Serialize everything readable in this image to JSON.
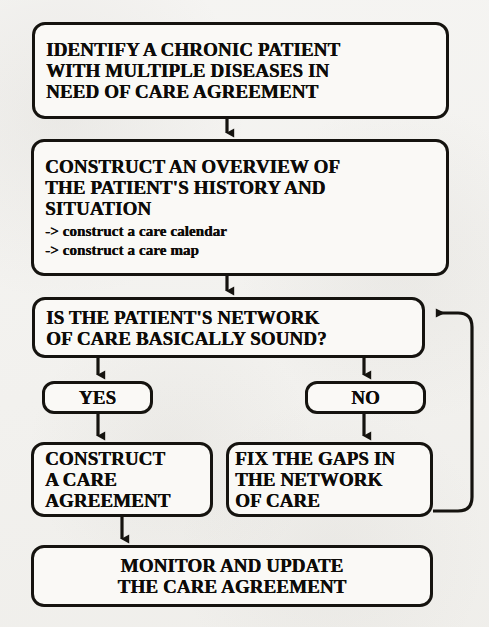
{
  "diagram": {
    "background_color": "#f2f1ee",
    "line_color": "#15130f",
    "node_fill_color": "#faf9f6",
    "nodes": {
      "identify": {
        "id": "identify",
        "shape": "rounded-rectangle",
        "lines": [
          "IDENTIFY A CHRONIC PATIENT",
          "WITH MULTIPLE DISEASES IN",
          "NEED OF CARE AGREEMENT"
        ]
      },
      "overview": {
        "id": "overview",
        "shape": "rounded-rectangle",
        "lines": [
          "CONSTRUCT AN OVERVIEW OF",
          "THE PATIENT'S HISTORY AND",
          "SITUATION"
        ],
        "sub_lines": [
          "-> construct a care calendar",
          "-> construct a care map"
        ]
      },
      "decision": {
        "id": "decision",
        "shape": "rounded-rectangle",
        "lines": [
          "IS THE PATIENT'S NETWORK",
          "OF CARE BASICALLY SOUND?"
        ]
      },
      "yes": {
        "id": "yes",
        "shape": "rounded-rectangle",
        "label": "YES"
      },
      "no": {
        "id": "no",
        "shape": "rounded-rectangle",
        "label": "NO"
      },
      "construct_agreement": {
        "id": "construct_agreement",
        "shape": "rounded-rectangle",
        "lines": [
          "CONSTRUCT",
          "A CARE",
          "AGREEMENT"
        ]
      },
      "fix_gaps": {
        "id": "fix_gaps",
        "shape": "rounded-rectangle",
        "lines": [
          "FIX THE GAPS IN",
          "THE NETWORK",
          "OF CARE"
        ]
      },
      "monitor": {
        "id": "monitor",
        "shape": "rounded-rectangle",
        "lines": [
          "MONITOR AND UPDATE",
          "THE CARE AGREEMENT"
        ]
      }
    },
    "edges": [
      {
        "from": "identify",
        "to": "overview",
        "label": "",
        "style": "straight-arrow-down"
      },
      {
        "from": "overview",
        "to": "decision",
        "label": "",
        "style": "straight-arrow-down"
      },
      {
        "from": "decision",
        "to": "yes",
        "label": "",
        "style": "straight-arrow-down"
      },
      {
        "from": "decision",
        "to": "no",
        "label": "",
        "style": "straight-arrow-down"
      },
      {
        "from": "yes",
        "to": "construct_agreement",
        "label": "",
        "style": "straight-arrow-down"
      },
      {
        "from": "no",
        "to": "fix_gaps",
        "label": "",
        "style": "straight-arrow-down"
      },
      {
        "from": "construct_agreement",
        "to": "monitor",
        "label": "",
        "style": "straight-arrow-down"
      },
      {
        "from": "fix_gaps",
        "to": "decision",
        "label": "",
        "style": "feedback-loop-right"
      }
    ]
  }
}
